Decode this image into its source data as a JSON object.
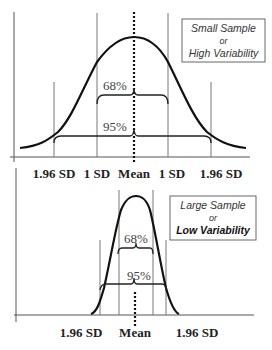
{
  "top_panel": {
    "caption_lines": [
      "Small Sample",
      "or",
      "High Variability"
    ],
    "bracket_inner_label": "68%",
    "bracket_outer_label": "95%",
    "axis_labels": [
      "1.96 SD",
      "1 SD",
      "Mean",
      "1 SD",
      "1.96 SD"
    ]
  },
  "bottom_panel": {
    "caption_lines": [
      "Large Sample",
      "or",
      "Low Variability"
    ],
    "bracket_inner_label": "68%",
    "bracket_outer_label": "95%",
    "axis_labels": [
      "1.96 SD",
      "Mean",
      "1.96 SD"
    ]
  },
  "colors": {
    "curve": "#111111",
    "guide_lines": "#777777",
    "box_border": "#666666"
  }
}
